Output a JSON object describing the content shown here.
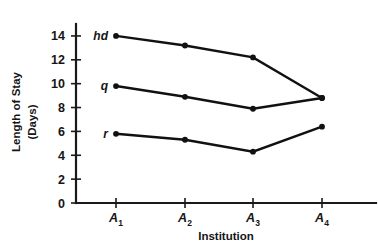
{
  "chart_data": {
    "type": "line",
    "title": "",
    "xlabel": "Institution",
    "ylabel": "Length of Stay (Days)",
    "ylabel_line1": "Length of Stay",
    "ylabel_line2": "(Days)",
    "categories": [
      "A1",
      "A2",
      "A3",
      "A4"
    ],
    "x_tick_labels": [
      {
        "base": "A",
        "sub": "1"
      },
      {
        "base": "A",
        "sub": "2"
      },
      {
        "base": "A",
        "sub": "3"
      },
      {
        "base": "A",
        "sub": "4"
      }
    ],
    "y_tick_labels": [
      "14",
      "12",
      "10",
      "8",
      "6",
      "4",
      "2",
      "0"
    ],
    "y_ticks": [
      14,
      12,
      10,
      8,
      6,
      4,
      2,
      0
    ],
    "ylim": [
      0,
      15
    ],
    "xlim": [
      0.4,
      4.9
    ],
    "grid": false,
    "legend": "inline-labels-at-left",
    "series": [
      {
        "name": "hd",
        "label": "hd",
        "values": [
          14.0,
          13.2,
          12.2,
          8.8
        ]
      },
      {
        "name": "q",
        "label": "q",
        "values": [
          9.8,
          8.9,
          7.9,
          8.8
        ]
      },
      {
        "name": "r",
        "label": "r",
        "values": [
          5.8,
          5.3,
          4.3,
          6.4
        ]
      }
    ],
    "colors": {
      "line": "#111111",
      "marker": "#111111",
      "axis": "#1a1a1a",
      "text": "#151515",
      "background": "#ffffff"
    }
  }
}
